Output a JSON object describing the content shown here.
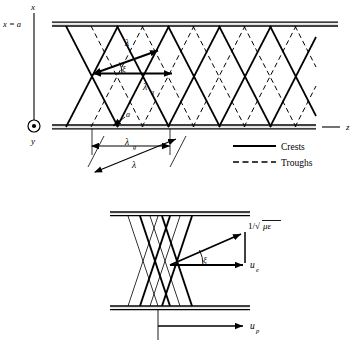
{
  "figure": {
    "type": "waveguide-wave-diagram",
    "background": "#ffffff",
    "ink": "#000000"
  },
  "upper_panel": {
    "axes": {
      "x_axis_label": "x",
      "wall_label": "x = a",
      "y_axis_label": "y",
      "y_axis_icon": "circle-dot-out-of-page-icon",
      "z_axis_label": "z"
    },
    "annotations": {
      "lambda": "λ",
      "lambda_g": "λ",
      "lambda_g_sub": "g",
      "xi": "ξ",
      "spacing_a": "a",
      "lambda_diagonal": "λ",
      "lambda_g_dim": "λ",
      "lambda_g_dim_sub": "g"
    },
    "legend": {
      "items": [
        {
          "label": "Crests",
          "style": "solid",
          "swatch": "solid-line-swatch"
        },
        {
          "label": "Troughs",
          "style": "dashed",
          "swatch": "dashed-line-swatch"
        }
      ]
    }
  },
  "lower_panel": {
    "annotations": {
      "light_speed": "1/√",
      "light_speed_radicand": "με",
      "energy_velocity": "u",
      "energy_velocity_sub": "e",
      "phase_velocity": "u",
      "phase_velocity_sub": "p",
      "xi": "ξ"
    }
  }
}
